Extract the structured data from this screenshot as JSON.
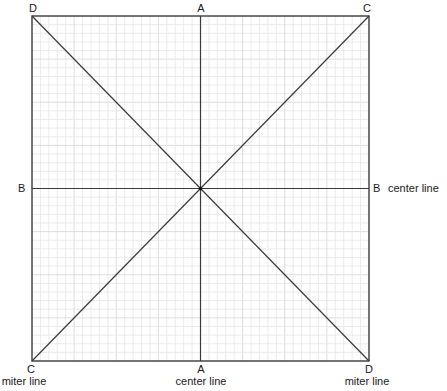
{
  "diagram": {
    "square": {
      "left": 32,
      "top": 16,
      "right": 369,
      "bottom": 361
    },
    "grid": {
      "cells": 40,
      "minor_color": "#e6e6e6",
      "major_every": 5,
      "major_color": "#d4d4d4"
    },
    "line_color": "#3a3a3a",
    "corners": {
      "top_left": "D",
      "top_right": "C",
      "bottom_left": "C",
      "bottom_right": "D"
    },
    "midpoints": {
      "top": "A",
      "bottom": "A",
      "left": "B",
      "right": "B"
    },
    "captions": {
      "right_center": "center line",
      "bottom_center": "center line",
      "bottom_left": "miter line",
      "bottom_right": "miter line"
    }
  }
}
